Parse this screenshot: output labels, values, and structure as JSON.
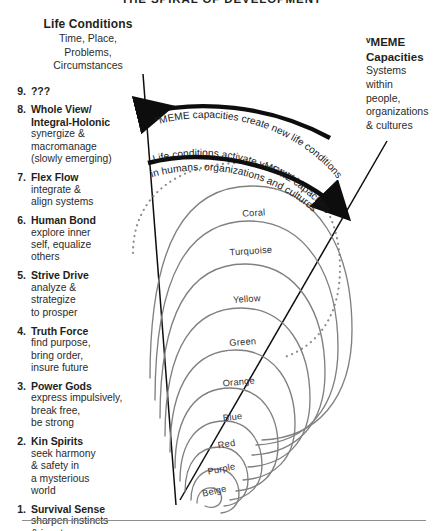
{
  "title": "THE SPIRAL OF DEVELOPMENT",
  "life_conditions": {
    "heading": "Life Conditions",
    "lines": [
      "Time, Place,",
      "Problems,",
      "Circumstances"
    ]
  },
  "vmeme_capacities": {
    "heading_line1": "vMEME",
    "heading_line2": "Capacities",
    "lines": [
      "Systems",
      "within",
      "people,",
      "organizations",
      "& cultures"
    ]
  },
  "arcs": {
    "upper": "vMEME capacities create new life conditions",
    "lower_line1": "Life conditions activate vMEME capacities",
    "lower_line2": "in humans, organizations and cultures"
  },
  "levels": [
    {
      "num": "9.",
      "name": "???",
      "desc": []
    },
    {
      "num": "8.",
      "name": "Whole View/\nIntegral-Holonic",
      "desc": [
        "synergize &",
        "macromanage",
        "(slowly emerging)"
      ]
    },
    {
      "num": "7.",
      "name": "Flex Flow",
      "desc": [
        "integrate &",
        "align systems"
      ]
    },
    {
      "num": "6.",
      "name": "Human Bond",
      "desc": [
        "explore inner",
        "self, equalize",
        "others"
      ]
    },
    {
      "num": "5.",
      "name": "Strive Drive",
      "desc": [
        "analyze &",
        "strategize",
        "to prosper"
      ]
    },
    {
      "num": "4.",
      "name": "Truth Force",
      "desc": [
        "find purpose,",
        "bring order,",
        "insure future"
      ]
    },
    {
      "num": "3.",
      "name": "Power Gods",
      "desc": [
        "express impulsively,",
        "break free,",
        "be strong"
      ]
    },
    {
      "num": "2.",
      "name": "Kin Spirits",
      "desc": [
        "seek harmony",
        "& safety in",
        "a mysterious",
        "world"
      ]
    },
    {
      "num": "1.",
      "name": "Survival Sense",
      "desc": [
        "sharpen instincts",
        "& innate senses"
      ]
    }
  ],
  "spiral_labels": [
    "Coral",
    "Turquoise",
    "Yellow",
    "Green",
    "Orange",
    "Blue",
    "Red",
    "Purple",
    "Beige"
  ],
  "colors": {
    "ink": "#231f20",
    "spiral_stroke": "#808080",
    "dotted_stroke": "#8c8c8c",
    "arrow": "#0d0d0d",
    "rule": "#8e8e8e",
    "background": "#ffffff"
  }
}
